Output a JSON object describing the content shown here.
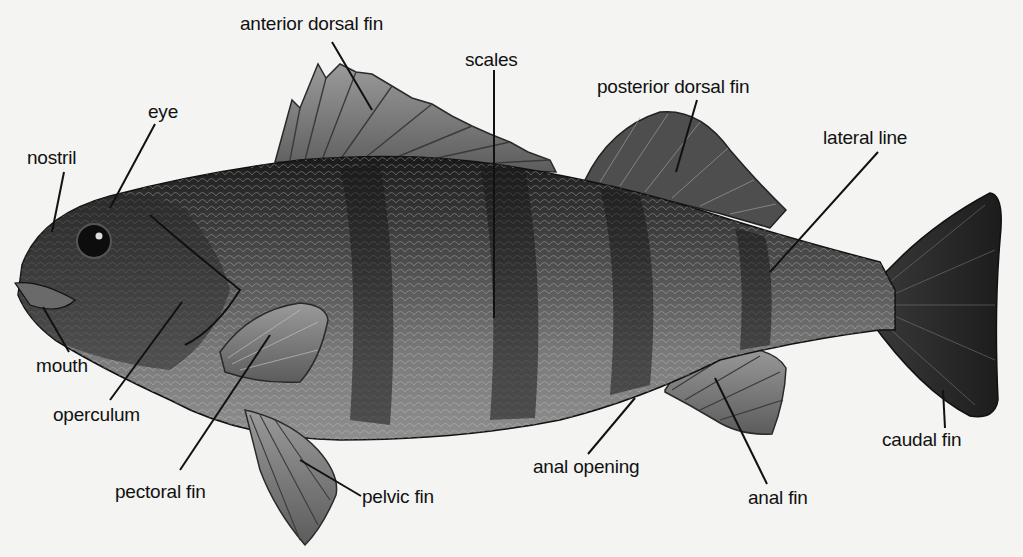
{
  "diagram": {
    "colors": {
      "background": "#f4f4f2",
      "body_dark": "#1e1e1e",
      "body_mid": "#6a6a6a",
      "body_light": "#a8a8a8",
      "fin": "#7c7c7c",
      "label_text": "#111111",
      "leader_line": "#111111"
    },
    "labels": [
      {
        "id": "anterior-dorsal-fin",
        "text": "anterior dorsal fin",
        "x": 240,
        "y": 14
      },
      {
        "id": "scales",
        "text": "scales",
        "x": 455,
        "y": 50
      },
      {
        "id": "posterior-dorsal-fin",
        "text": "posterior dorsal fin",
        "x": 597,
        "y": 77
      },
      {
        "id": "lateral-line",
        "text": "lateral line",
        "x": 823,
        "y": 128
      },
      {
        "id": "eye",
        "text": "eye",
        "x": 148,
        "y": 102
      },
      {
        "id": "nostril",
        "text": "nostril",
        "x": 27,
        "y": 148
      },
      {
        "id": "mouth",
        "text": "mouth",
        "x": 36,
        "y": 356
      },
      {
        "id": "operculum",
        "text": "operculum",
        "x": 53,
        "y": 405
      },
      {
        "id": "pectoral-fin",
        "text": "pectoral fin",
        "x": 115,
        "y": 482
      },
      {
        "id": "pelvic-fin",
        "text": "pelvic fin",
        "x": 362,
        "y": 487
      },
      {
        "id": "anal-opening",
        "text": "anal opening",
        "x": 533,
        "y": 457
      },
      {
        "id": "anal-fin",
        "text": "anal fin",
        "x": 748,
        "y": 488
      },
      {
        "id": "caudal-fin",
        "text": "caudal fin",
        "x": 882,
        "y": 430
      }
    ]
  }
}
